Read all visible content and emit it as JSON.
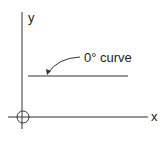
{
  "diagram": {
    "axis_y_label": "y",
    "axis_x_label": "x",
    "curve_label": "0° curve",
    "stroke_color": "#333333"
  }
}
